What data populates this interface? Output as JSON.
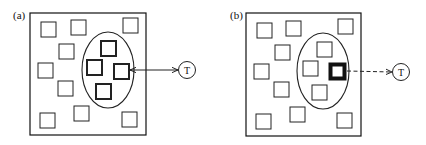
{
  "panels": [
    {
      "label": "(a)",
      "target_label": "T",
      "connection": "bidirectional-solid",
      "outside_squares": 10,
      "ellipse_squares": [
        {
          "emphasis": "bold"
        },
        {
          "emphasis": "bold"
        },
        {
          "emphasis": "bold"
        },
        {
          "emphasis": "bold"
        }
      ]
    },
    {
      "label": "(b)",
      "target_label": "T",
      "connection": "dashed-arrow",
      "outside_squares": 10,
      "ellipse_squares": [
        {
          "emphasis": "normal"
        },
        {
          "emphasis": "normal"
        },
        {
          "emphasis": "heavy"
        },
        {
          "emphasis": "normal"
        }
      ]
    }
  ],
  "colors": {
    "stroke": "#111111",
    "background": "#ffffff"
  }
}
